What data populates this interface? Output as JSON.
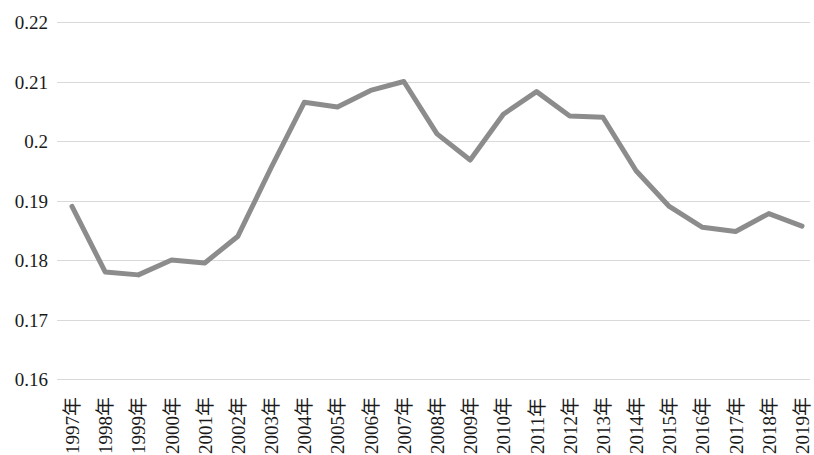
{
  "chart_data": {
    "type": "line",
    "title": "",
    "xlabel": "",
    "ylabel": "",
    "grid": true,
    "legend": "none",
    "line_color": "#8c8c8c",
    "line_width": 5,
    "background_color": "#ffffff",
    "gridline_color": "#d9d9d9",
    "ylim": [
      0.16,
      0.22
    ],
    "y_ticks": [
      "0.16",
      "0.17",
      "0.18",
      "0.19",
      "0.2",
      "0.21",
      "0.22"
    ],
    "y_tick_values": [
      0.16,
      0.17,
      0.18,
      0.19,
      0.2,
      0.21,
      0.22
    ],
    "categories": [
      "1997年",
      "1998年",
      "1999年",
      "2000年",
      "2001年",
      "2002年",
      "2003年",
      "2004年",
      "2005年",
      "2006年",
      "2007年",
      "2008年",
      "2009年",
      "2010年",
      "2011年",
      "2012年",
      "2013年",
      "2014年",
      "2015年",
      "2016年",
      "2017年",
      "2018年",
      "2019年"
    ],
    "values": [
      0.189,
      0.178,
      0.1775,
      0.18,
      0.1795,
      0.184,
      0.1955,
      0.2065,
      0.2057,
      0.2085,
      0.21,
      0.2012,
      0.1968,
      0.2045,
      0.2083,
      0.2042,
      0.204,
      0.195,
      0.189,
      0.1855,
      0.1848,
      0.1878,
      0.1857
    ],
    "series": [
      {
        "name": "",
        "values": [
          0.189,
          0.178,
          0.1775,
          0.18,
          0.1795,
          0.184,
          0.1955,
          0.2065,
          0.2057,
          0.2085,
          0.21,
          0.2012,
          0.1968,
          0.2045,
          0.2083,
          0.2042,
          0.204,
          0.195,
          0.189,
          0.1855,
          0.1848,
          0.1878,
          0.1857
        ]
      }
    ]
  }
}
